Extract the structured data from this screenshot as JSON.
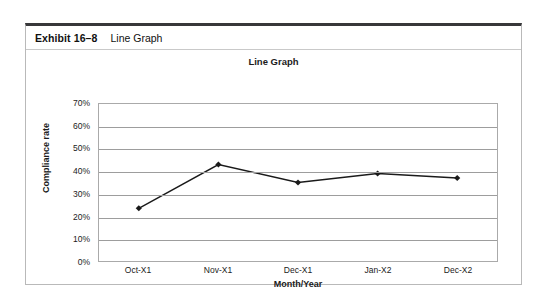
{
  "exhibit": {
    "number": "Exhibit 16–8",
    "title": "Line Graph"
  },
  "chart_data": {
    "type": "line",
    "title": "Line Graph",
    "xlabel": "Month/Year",
    "ylabel": "Compliance rate",
    "categories": [
      "Oct-X1",
      "Nov-X1",
      "Dec-X1",
      "Jan-X2",
      "Dec-X2"
    ],
    "values": [
      23.5,
      43,
      35,
      39,
      37
    ],
    "ylim": [
      0,
      70
    ],
    "ytick_labels": [
      "0%",
      "10%",
      "20%",
      "30%",
      "40%",
      "50%",
      "60%",
      "70%"
    ],
    "ytick_values": [
      0,
      10,
      20,
      30,
      40,
      50,
      60,
      70
    ],
    "grid": "horizontal",
    "legend": "none",
    "series": [
      {
        "name": "Compliance rate",
        "values": [
          23.5,
          43,
          35,
          39,
          37
        ],
        "line_color": "#1a1a1a",
        "marker": "diamond",
        "marker_color": "#1a1a1a"
      }
    ],
    "colors": {
      "line": "#1a1a1a",
      "gridline": "#9d9d9d",
      "plot_border": "#aaaaaa",
      "text": "#1b1b1b"
    }
  }
}
